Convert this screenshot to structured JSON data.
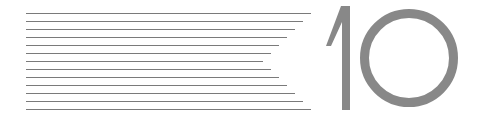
{
  "graphic": {
    "number_label": "10",
    "line_color": "#7a7a7a",
    "glyph_color": "#888888",
    "lines": [
      {
        "y": 13,
        "x1": 26,
        "x2": 311
      },
      {
        "y": 21,
        "x1": 26,
        "x2": 303
      },
      {
        "y": 29,
        "x1": 26,
        "x2": 295
      },
      {
        "y": 37,
        "x1": 26,
        "x2": 287
      },
      {
        "y": 45,
        "x1": 26,
        "x2": 279
      },
      {
        "y": 53,
        "x1": 26,
        "x2": 271
      },
      {
        "y": 61,
        "x1": 26,
        "x2": 263
      },
      {
        "y": 69,
        "x1": 26,
        "x2": 271
      },
      {
        "y": 77,
        "x1": 26,
        "x2": 279
      },
      {
        "y": 85,
        "x1": 26,
        "x2": 287
      },
      {
        "y": 93,
        "x1": 26,
        "x2": 295
      },
      {
        "y": 101,
        "x1": 26,
        "x2": 303
      },
      {
        "y": 109,
        "x1": 26,
        "x2": 311
      }
    ]
  }
}
